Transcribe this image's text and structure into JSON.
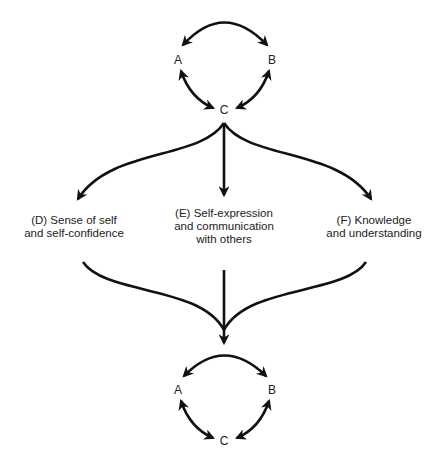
{
  "diagram": {
    "type": "flow",
    "top_cycle": {
      "nodes": [
        {
          "id": "A",
          "label": "A"
        },
        {
          "id": "B",
          "label": "B"
        },
        {
          "id": "C",
          "label": "C"
        }
      ],
      "edges": [
        {
          "from": "A",
          "to": "B",
          "bidirectional": true
        },
        {
          "from": "A",
          "to": "C",
          "bidirectional": true
        },
        {
          "from": "B",
          "to": "C",
          "bidirectional": true
        }
      ]
    },
    "outcomes": [
      {
        "id": "D",
        "lines": [
          "(D) Sense of self",
          "and self-confidence"
        ]
      },
      {
        "id": "E",
        "lines": [
          "(E) Self-expression",
          "and communication",
          "with others"
        ]
      },
      {
        "id": "F",
        "lines": [
          "(F) Knowledge",
          "and understanding"
        ]
      }
    ],
    "bottom_cycle": {
      "nodes": [
        {
          "id": "A",
          "label": "A"
        },
        {
          "id": "B",
          "label": "B"
        },
        {
          "id": "C",
          "label": "C"
        }
      ],
      "edges": [
        {
          "from": "A",
          "to": "B",
          "bidirectional": true
        },
        {
          "from": "A",
          "to": "C",
          "bidirectional": true
        },
        {
          "from": "B",
          "to": "C",
          "bidirectional": true
        }
      ]
    },
    "flows": [
      {
        "from": "top.C",
        "to": "D"
      },
      {
        "from": "top.C",
        "to": "E"
      },
      {
        "from": "top.C",
        "to": "F"
      },
      {
        "from": "D",
        "to": "bottom"
      },
      {
        "from": "E",
        "to": "bottom"
      },
      {
        "from": "F",
        "to": "bottom"
      }
    ],
    "colors": {
      "stroke": "#111111",
      "text": "#222222",
      "background": "#ffffff"
    }
  }
}
